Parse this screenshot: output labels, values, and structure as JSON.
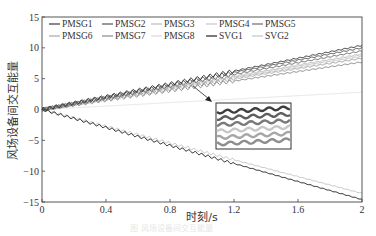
{
  "chart_data": {
    "type": "line",
    "title": "",
    "xlabel": "时刻/s",
    "ylabel": "风场设备间交互能量",
    "xlim": [
      0,
      2
    ],
    "ylim": [
      -15,
      15
    ],
    "xticks": [
      "0",
      "0.4",
      "0.8",
      "1.2",
      "1.6",
      "2"
    ],
    "yticks": [
      "15",
      "10",
      "5",
      "0",
      "−5",
      "−10",
      "−15"
    ],
    "grid": false,
    "legend_position": "top-left inside, 5 columns",
    "x": [
      0,
      2
    ],
    "series": [
      {
        "name": "PMSG1",
        "color": "#3a3a3a",
        "values": [
          0,
          10.4
        ]
      },
      {
        "name": "PMSG2",
        "color": "#555555",
        "values": [
          0,
          10.0
        ]
      },
      {
        "name": "PMSG3",
        "color": "#bdbdbd",
        "values": [
          0,
          9.0
        ]
      },
      {
        "name": "PMSG4",
        "color": "#c8c8c8",
        "values": [
          0,
          8.6
        ]
      },
      {
        "name": "PMSG5",
        "color": "#6e6e6e",
        "values": [
          0,
          9.5
        ]
      },
      {
        "name": "PMSG6",
        "color": "#a8a8a8",
        "values": [
          0,
          8.3
        ]
      },
      {
        "name": "PMSG7",
        "color": "#8c8c8c",
        "values": [
          0,
          7.7
        ]
      },
      {
        "name": "PMSG8",
        "color": "#d8d8d8",
        "values": [
          0,
          8.8
        ]
      },
      {
        "name": "SVG1",
        "color": "#222222",
        "values": [
          0,
          -14.6
        ]
      },
      {
        "name": "SVG2",
        "color": "#c4c4c4",
        "values": [
          0,
          -13.6
        ]
      }
    ],
    "annotations": [
      {
        "type": "inset-zoom",
        "text": "zoomed view of oscillating PMSG curves near t≈0.95 s, y≈4"
      }
    ]
  },
  "caption": "图 风场设备间交互能量"
}
